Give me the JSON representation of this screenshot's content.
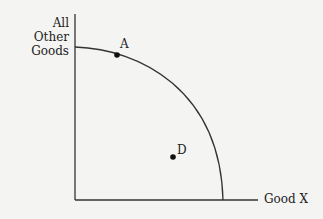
{
  "diagram": {
    "y_axis_label_line1": "All Other",
    "y_axis_label_line2": "Goods",
    "x_axis_label": "Good X",
    "points": [
      {
        "label": "A",
        "x": 117,
        "y": 55
      },
      {
        "label": "D",
        "x": 173,
        "y": 157
      }
    ]
  }
}
